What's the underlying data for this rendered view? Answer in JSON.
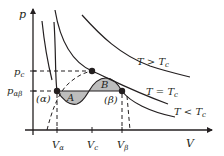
{
  "figure": {
    "axes": {
      "y_label": "p",
      "x_label": "V",
      "y_ticks": [
        {
          "name": "pc",
          "main": "p",
          "sub": "c"
        },
        {
          "name": "pab",
          "main": "p",
          "sub": "αβ"
        }
      ],
      "x_ticks": [
        {
          "name": "Va",
          "main": "V",
          "sub": "α"
        },
        {
          "name": "Vc",
          "main": "V",
          "sub": "c"
        },
        {
          "name": "Vb",
          "main": "V",
          "sub": "β"
        }
      ]
    },
    "curve_labels": {
      "above": "T > T",
      "above_sub": "c",
      "critical": "T = T",
      "critical_sub": "c",
      "below": "T < T",
      "below_sub": "c"
    },
    "region_labels": {
      "A": "A",
      "B": "B",
      "alpha": "(α)",
      "beta": "(β)"
    },
    "colors": {
      "line": "#231f20",
      "shade": "#bdbdbd",
      "background": "#ffffff"
    }
  }
}
